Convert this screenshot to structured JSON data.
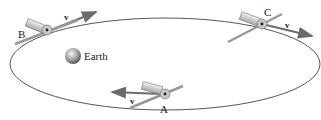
{
  "diagram": {
    "earth_label": "Earth",
    "points": [
      {
        "id": "A",
        "label": "A",
        "velocity_label": "v",
        "position": "bottom"
      },
      {
        "id": "B",
        "label": "B",
        "velocity_label": "v",
        "position": "upper-left"
      },
      {
        "id": "C",
        "label": "C",
        "velocity_label": "v",
        "position": "upper-right"
      }
    ],
    "colors": {
      "orbit": "#555555",
      "velocity_arrow": "#6b6b6b",
      "earth": "#9a9a9a",
      "satellite": "#d8d8d8"
    }
  }
}
